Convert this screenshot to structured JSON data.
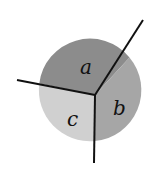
{
  "diagram": {
    "type": "partitioned-circle",
    "regions": [
      {
        "id": "a",
        "label": "a",
        "fill": "#8c8c8c"
      },
      {
        "id": "b",
        "label": "b",
        "fill": "#a6a6a6"
      },
      {
        "id": "c",
        "label": "c",
        "fill": "#d0d0d0"
      }
    ],
    "line_color": "#111111",
    "background": "#ffffff"
  }
}
